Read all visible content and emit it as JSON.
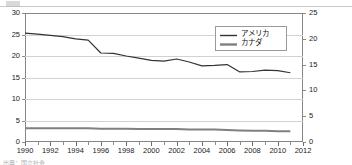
{
  "chart_data": {
    "type": "line",
    "title": "",
    "subtitle": "",
    "xlabel": "",
    "ylabel": "",
    "ylabel_right": "",
    "grid": true,
    "legend_position": "top-right",
    "x": [
      1990,
      1991,
      1992,
      1993,
      1994,
      1995,
      1996,
      1997,
      1998,
      1999,
      2000,
      2001,
      2002,
      2003,
      2004,
      2005,
      2006,
      2007,
      2008,
      2009,
      2010,
      2011
    ],
    "xlim": [
      1990,
      2012
    ],
    "xticks": [
      1990,
      1992,
      1994,
      1996,
      1998,
      2000,
      2002,
      2004,
      2006,
      2008,
      2010,
      2012
    ],
    "xtick_labels": [
      "1990",
      "1992",
      "1994",
      "1996",
      "1998",
      "2000",
      "2002",
      "2004",
      "2006",
      "2008",
      "2010",
      "2012"
    ],
    "ylim": [
      0,
      30
    ],
    "yticks": [
      0,
      5,
      10,
      15,
      20,
      25,
      30
    ],
    "ytick_labels": [
      "0",
      "5",
      "10",
      "15",
      "20",
      "25",
      "30"
    ],
    "ylim_right": [
      0,
      25
    ],
    "yticks_right": [
      0,
      5,
      10,
      15,
      20,
      25
    ],
    "ytick_labels_right": [
      "0",
      "5",
      "10",
      "15",
      "20",
      "25"
    ],
    "series": [
      {
        "name": "アメリカ",
        "axis": "left",
        "color": "#333333",
        "width": 1.2,
        "values": [
          25.3,
          25.1,
          24.8,
          24.5,
          24.0,
          23.7,
          20.7,
          20.6,
          20.0,
          19.5,
          19.0,
          18.8,
          19.3,
          18.6,
          17.7,
          17.8,
          18.0,
          16.3,
          16.4,
          16.7,
          16.6,
          16.1
        ]
      },
      {
        "name": "カナダ",
        "axis": "left",
        "color": "#808080",
        "width": 2.0,
        "values": [
          3.2,
          3.2,
          3.2,
          3.2,
          3.2,
          3.2,
          3.1,
          3.1,
          3.1,
          3.0,
          3.0,
          3.0,
          3.0,
          2.9,
          2.9,
          2.9,
          2.8,
          2.7,
          2.6,
          2.6,
          2.5,
          2.5
        ]
      }
    ]
  },
  "legend": {
    "entries": [
      {
        "label": "アメリカ"
      },
      {
        "label": "カナダ"
      }
    ]
  },
  "footer": {
    "fragment": "出典：国立社会"
  }
}
